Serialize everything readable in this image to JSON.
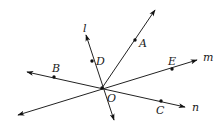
{
  "diagram": {
    "type": "geometry-rays-and-lines",
    "center": {
      "name": "O",
      "x": 102,
      "y": 88,
      "label": "O",
      "label_x": 107,
      "label_y": 102
    },
    "rays": [
      {
        "id": "ray-OA",
        "from": [
          102,
          88
        ],
        "to": [
          155,
          10
        ]
      }
    ],
    "lines": [
      {
        "id": "line-l",
        "name": "l",
        "p1": [
          86,
          35
        ],
        "p2": [
          114,
          120
        ],
        "arrows": "both",
        "label": "l",
        "label_x": 83,
        "label_y": 32
      },
      {
        "id": "line-m",
        "name": "m",
        "p1": [
          18,
          115
        ],
        "p2": [
          197,
          60
        ],
        "arrows": "both",
        "label": "m",
        "label_x": 203,
        "label_y": 61
      },
      {
        "id": "line-n",
        "name": "n",
        "p1": [
          27,
          72
        ],
        "p2": [
          185,
          107
        ],
        "arrows": "both",
        "label": "n",
        "label_x": 192,
        "label_y": 111
      }
    ],
    "points": [
      {
        "name": "A",
        "x": 135,
        "y": 40,
        "label": "A",
        "label_x": 139,
        "label_y": 47
      },
      {
        "name": "B",
        "x": 54,
        "y": 77,
        "label": "B",
        "label_x": 52,
        "label_y": 72
      },
      {
        "name": "C",
        "x": 161,
        "y": 101,
        "label": "C",
        "label_x": 156,
        "label_y": 114
      },
      {
        "name": "D",
        "x": 92,
        "y": 61,
        "label": "D",
        "label_x": 96,
        "label_y": 65
      },
      {
        "name": "E",
        "x": 172,
        "y": 69,
        "label": "E",
        "label_x": 168,
        "label_y": 65
      },
      {
        "name": "O",
        "x": 102,
        "y": 88
      }
    ]
  },
  "labels": {
    "A": "A",
    "B": "B",
    "C": "C",
    "D": "D",
    "E": "E",
    "O": "O",
    "l": "l",
    "m": "m",
    "n": "n"
  }
}
